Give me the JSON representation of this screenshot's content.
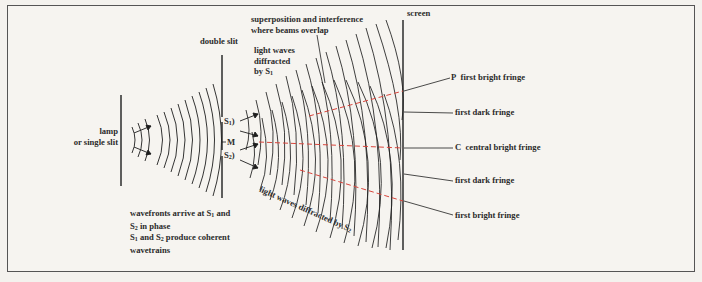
{
  "diagram": {
    "labels": {
      "lamp_line1": "lamp",
      "lamp_line2": "or single slit",
      "double_slit": "double slit",
      "s1": "S",
      "s1_sub": "1",
      "m": "M",
      "s2": "S",
      "s2_sub": "2",
      "diffracted_s1_line1": "light waves",
      "diffracted_s1_line2": "diffracted",
      "diffracted_s1_line3": "by S",
      "diffracted_s1_sub": "1",
      "superposition_line1": "superposition and interference",
      "superposition_line2": "where beams overlap",
      "screen": "screen",
      "diffracted_s2": "light waves diffracted by S",
      "diffracted_s2_sub": "2",
      "wavefronts_line1": "wavefronts arrive at S",
      "wavefronts_line1_sub": "1",
      "wavefronts_line1_end": " and",
      "wavefronts_line2": "S",
      "wavefronts_line2_sub": "2",
      "wavefronts_line2_end": " in phase",
      "coherent_line1a": "S",
      "coherent_line1a_sub": "1",
      "coherent_line1b": " and S",
      "coherent_line1b_sub": "2",
      "coherent_line1c": " produce coherent",
      "coherent_line2": "wavetrains"
    },
    "fringes": [
      {
        "letter": "P",
        "label": "first bright fringe"
      },
      {
        "letter": "",
        "label": "first dark fringe"
      },
      {
        "letter": "C",
        "label": "central bright fringe"
      },
      {
        "letter": "",
        "label": "first dark fringe"
      },
      {
        "letter": "",
        "label": "first bright fringe"
      }
    ],
    "colors": {
      "line": "#1e1e1e",
      "fringe_dash": "#d9453c",
      "background": "#f6f4f0"
    }
  }
}
